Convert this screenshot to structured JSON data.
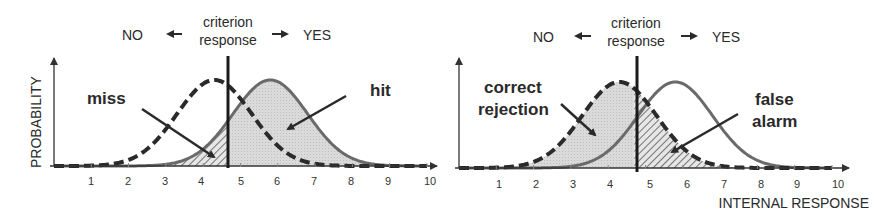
{
  "chart_data": [
    {
      "type": "line",
      "title": "Signal detection: hits and misses",
      "header": {
        "left": "NO",
        "center_line1": "criterion",
        "center_line2": "response",
        "right": "YES"
      },
      "ylabel": "PROBABILITY",
      "xlabel": "",
      "x_ticks": [
        "1",
        "2",
        "3",
        "4",
        "5",
        "6",
        "7",
        "8",
        "9",
        "10"
      ],
      "xlim": [
        0,
        10
      ],
      "criterion": 4.7,
      "series": [
        {
          "name": "noise",
          "style": "dashed",
          "mean": 4.3,
          "sd": 1.0
        },
        {
          "name": "signal+noise",
          "style": "solid",
          "mean": 5.8,
          "sd": 1.0
        }
      ],
      "annotations": [
        {
          "text": "miss",
          "region": "signal below criterion (hatched)"
        },
        {
          "text": "hit",
          "region": "signal above criterion (dotted fill)"
        }
      ]
    },
    {
      "type": "line",
      "title": "Signal detection: correct rejections and false alarms",
      "header": {
        "left": "NO",
        "center_line1": "criterion",
        "center_line2": "response",
        "right": "YES"
      },
      "ylabel": "",
      "xlabel": "INTERNAL RESPONSE",
      "x_ticks": [
        "1",
        "2",
        "3",
        "4",
        "5",
        "6",
        "7",
        "8",
        "9",
        "10"
      ],
      "xlim": [
        0,
        10
      ],
      "criterion": 4.7,
      "series": [
        {
          "name": "noise",
          "style": "dashed",
          "mean": 4.3,
          "sd": 1.0
        },
        {
          "name": "signal+noise",
          "style": "solid",
          "mean": 5.8,
          "sd": 1.0
        }
      ],
      "annotations": [
        {
          "text": "correct rejection",
          "lines": [
            "correct",
            "rejection"
          ],
          "region": "noise below criterion (dotted fill)"
        },
        {
          "text": "false alarm",
          "lines": [
            "false",
            "alarm"
          ],
          "region": "noise above criterion (hatched)"
        }
      ]
    }
  ],
  "labels": {
    "left": {
      "no": "NO",
      "crit1": "criterion",
      "crit2": "response",
      "yes": "YES",
      "ylabel": "PROBABILITY",
      "miss": "miss",
      "hit": "hit"
    },
    "right": {
      "no": "NO",
      "crit1": "criterion",
      "crit2": "response",
      "yes": "YES",
      "xlabel": "INTERNAL RESPONSE",
      "cr1": "correct",
      "cr2": "rejection",
      "fa1": "false",
      "fa2": "alarm"
    },
    "ticks": [
      "1",
      "2",
      "3",
      "4",
      "5",
      "6",
      "7",
      "8",
      "9",
      "10"
    ]
  },
  "colors": {
    "ink": "#2a2a2a",
    "signal_curve": "#6a6a6a",
    "fill": "#d8d8d8",
    "hatch": "#555555"
  }
}
